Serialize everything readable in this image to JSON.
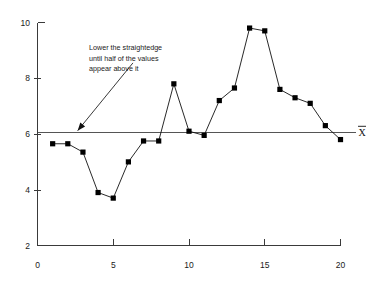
{
  "chart_data": {
    "type": "line",
    "title": "",
    "subtitle": "",
    "xlabel": "",
    "ylabel": "",
    "x": [
      1,
      2,
      3,
      4,
      5,
      6,
      7,
      8,
      9,
      10,
      11,
      12,
      13,
      14,
      15,
      16,
      17,
      18,
      19,
      20
    ],
    "values": [
      5.65,
      5.65,
      5.35,
      3.9,
      3.7,
      5.0,
      5.75,
      5.75,
      7.8,
      6.1,
      5.95,
      7.2,
      7.65,
      9.8,
      9.7,
      7.6,
      7.3,
      7.1,
      6.3,
      5.8
    ],
    "series": [
      {
        "name": "observations",
        "values": [
          5.65,
          5.65,
          5.35,
          3.9,
          3.7,
          5.0,
          5.75,
          5.75,
          7.8,
          6.1,
          5.95,
          7.2,
          7.65,
          9.8,
          9.7,
          7.6,
          7.3,
          7.1,
          6.3,
          5.8
        ],
        "marker": "square",
        "marker_color": "#000000",
        "line_color": "#111111"
      }
    ],
    "xlim": [
      0,
      20
    ],
    "ylim": [
      2,
      10
    ],
    "xticks": [
      0,
      5,
      10,
      15,
      20
    ],
    "xtick_labels": [
      "0",
      "5",
      "10",
      "15",
      "20"
    ],
    "yticks": [
      2,
      4,
      6,
      8,
      10
    ],
    "ytick_labels": [
      "2",
      "4",
      "6",
      "8",
      "10"
    ],
    "grid": false,
    "legend": null,
    "reference_lines": [
      {
        "name": "mean-line",
        "orientation": "horizontal",
        "value": 6.05,
        "label": "X̄",
        "label_position": "right",
        "color": "#555555"
      }
    ],
    "annotations": [
      {
        "name": "straightedge-note",
        "lines": [
          "Lower the straightedge",
          "until half of the values",
          "appear above it"
        ],
        "arrow_from": {
          "x": 6.3,
          "y": 8.55
        },
        "arrow_to": {
          "x": 2.65,
          "y": 6.12
        }
      }
    ]
  },
  "axis": {
    "x_label_0": "0",
    "x_label_5": "5",
    "x_label_10": "10",
    "x_label_15": "15",
    "x_label_20": "20",
    "y_label_2": "2",
    "y_label_4": "4",
    "y_label_6": "6",
    "y_label_8": "8",
    "y_label_10": "10"
  },
  "annotation": {
    "line1": "Lower the straightedge",
    "line2": "until half of the values",
    "line3": "appear above it"
  },
  "mean": {
    "symbol": "X"
  }
}
